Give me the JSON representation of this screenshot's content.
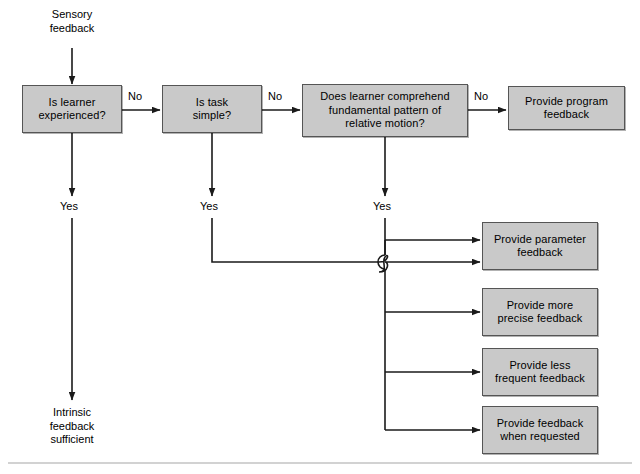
{
  "diagram": {
    "type": "flowchart",
    "colors": {
      "node_fill": "#c9c9c9",
      "node_border": "#555555",
      "line": "#1a1a1a",
      "background": "#ffffff",
      "footer_rule": "#d2d2d2"
    },
    "entry_label": "Sensory\nfeedback",
    "terminal_label": "Intrinsic\nfeedback\nsufficient",
    "decisions": [
      {
        "id": "learner-experienced",
        "label": "Is learner\nexperienced?"
      },
      {
        "id": "task-simple",
        "label": "Is task\nsimple?"
      },
      {
        "id": "comprehend-pattern",
        "label": "Does learner comprehend\nfundamental pattern of\nrelative motion?"
      }
    ],
    "outcomes": [
      {
        "id": "program-feedback",
        "label": "Provide program\nfeedback"
      },
      {
        "id": "parameter-feedback",
        "label": "Provide parameter\nfeedback"
      },
      {
        "id": "more-precise-feedback",
        "label": "Provide more\nprecise feedback"
      },
      {
        "id": "less-frequent-feedback",
        "label": "Provide less\nfrequent feedback"
      },
      {
        "id": "feedback-when-requested",
        "label": "Provide feedback\nwhen requested"
      }
    ],
    "edge_labels": {
      "no_1": "No",
      "no_2": "No",
      "no_3": "No",
      "yes_1": "Yes",
      "yes_2": "Yes",
      "yes_3": "Yes"
    }
  }
}
